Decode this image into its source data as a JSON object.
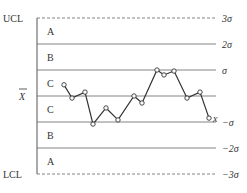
{
  "chart_data": {
    "type": "line",
    "left_labels": {
      "ucl": "UCL",
      "center": "X̄",
      "lcl": "LCL"
    },
    "right_labels": [
      "3σ",
      "2σ",
      "σ",
      "",
      "−σ",
      "−2σ",
      "−3σ"
    ],
    "zones": [
      "A",
      "B",
      "C",
      "C",
      "B",
      "A"
    ],
    "series_label": "x",
    "sigma_levels": [
      3,
      2,
      1,
      0,
      -1,
      -2,
      -3
    ],
    "x": [
      1,
      2,
      3,
      4,
      5,
      6,
      7,
      8,
      9,
      10,
      11,
      12,
      13,
      14
    ],
    "values": [
      0.43,
      -0.08,
      0.15,
      -1.08,
      -0.46,
      -0.92,
      0.0,
      -0.27,
      1.0,
      0.81,
      0.96,
      -0.08,
      0.15,
      -0.85
    ],
    "ylim": [
      -3,
      3
    ],
    "grid": true,
    "colors": {
      "line": "#333333",
      "axis": "#555555",
      "marker_fill": "#ffffff"
    }
  }
}
